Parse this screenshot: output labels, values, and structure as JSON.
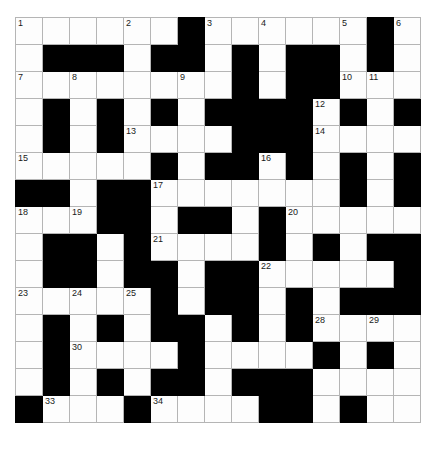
{
  "puzzle": {
    "type": "crossword-grid",
    "rows": 15,
    "columns": 15,
    "cell_size_px": 26,
    "colors": {
      "block": "#000000",
      "cell": "#fdfdfd",
      "grid_line": "#b5b5b5",
      "border": "#8a8a8a",
      "number_text": "#1a1a1a",
      "page_background": "#ffffff"
    },
    "highest_clue_number": 34,
    "grid": [
      [
        "o",
        "o",
        "o",
        "o",
        "o",
        "o",
        "x",
        "o",
        "o",
        "o",
        "o",
        "o",
        "o",
        "x",
        "o"
      ],
      [
        "o",
        "x",
        "x",
        "x",
        "o",
        "x",
        "x",
        "o",
        "x",
        "o",
        "x",
        "x",
        "o",
        "x",
        "o"
      ],
      [
        "o",
        "o",
        "o",
        "o",
        "o",
        "o",
        "o",
        "o",
        "x",
        "o",
        "x",
        "x",
        "o",
        "o",
        "o"
      ],
      [
        "o",
        "x",
        "o",
        "x",
        "o",
        "x",
        "o",
        "x",
        "x",
        "x",
        "x",
        "o",
        "x",
        "o",
        "x"
      ],
      [
        "o",
        "x",
        "o",
        "x",
        "o",
        "o",
        "o",
        "o",
        "x",
        "x",
        "x",
        "o",
        "o",
        "o",
        "o"
      ],
      [
        "o",
        "o",
        "o",
        "o",
        "o",
        "x",
        "o",
        "x",
        "x",
        "o",
        "x",
        "o",
        "x",
        "o",
        "x"
      ],
      [
        "x",
        "x",
        "o",
        "x",
        "x",
        "o",
        "o",
        "o",
        "o",
        "o",
        "o",
        "o",
        "x",
        "o",
        "x"
      ],
      [
        "o",
        "o",
        "o",
        "x",
        "x",
        "o",
        "x",
        "x",
        "o",
        "x",
        "o",
        "o",
        "o",
        "o",
        "o"
      ],
      [
        "o",
        "x",
        "x",
        "o",
        "x",
        "o",
        "o",
        "o",
        "o",
        "x",
        "o",
        "x",
        "o",
        "x",
        "x"
      ],
      [
        "o",
        "x",
        "x",
        "o",
        "x",
        "x",
        "o",
        "x",
        "x",
        "o",
        "o",
        "o",
        "o",
        "o",
        "x"
      ],
      [
        "o",
        "o",
        "o",
        "o",
        "o",
        "x",
        "o",
        "x",
        "x",
        "o",
        "x",
        "o",
        "x",
        "x",
        "x"
      ],
      [
        "o",
        "x",
        "o",
        "x",
        "o",
        "x",
        "x",
        "o",
        "x",
        "o",
        "x",
        "o",
        "o",
        "o",
        "o"
      ],
      [
        "o",
        "x",
        "o",
        "o",
        "o",
        "o",
        "x",
        "o",
        "o",
        "o",
        "o",
        "x",
        "o",
        "x",
        "o"
      ],
      [
        "o",
        "x",
        "o",
        "x",
        "o",
        "x",
        "x",
        "o",
        "x",
        "x",
        "x",
        "o",
        "o",
        "o",
        "o"
      ],
      [
        "x",
        "o",
        "o",
        "o",
        "x",
        "o",
        "o",
        "o",
        "o",
        "x",
        "x",
        "o",
        "x",
        "o",
        "o"
      ]
    ],
    "numbers": [
      {
        "row": 1,
        "col": 1,
        "n": 1
      },
      {
        "row": 1,
        "col": 5,
        "n": 2
      },
      {
        "row": 1,
        "col": 8,
        "n": 3
      },
      {
        "row": 1,
        "col": 10,
        "n": 4
      },
      {
        "row": 1,
        "col": 13,
        "n": 5
      },
      {
        "row": 1,
        "col": 15,
        "n": 6
      },
      {
        "row": 3,
        "col": 1,
        "n": 7
      },
      {
        "row": 3,
        "col": 3,
        "n": 8
      },
      {
        "row": 3,
        "col": 7,
        "n": 9
      },
      {
        "row": 3,
        "col": 13,
        "n": 10
      },
      {
        "row": 3,
        "col": 14,
        "n": 11
      },
      {
        "row": 4,
        "col": 12,
        "n": 12
      },
      {
        "row": 5,
        "col": 5,
        "n": 13
      },
      {
        "row": 5,
        "col": 12,
        "n": 14
      },
      {
        "row": 6,
        "col": 1,
        "n": 15
      },
      {
        "row": 6,
        "col": 10,
        "n": 16
      },
      {
        "row": 7,
        "col": 6,
        "n": 17
      },
      {
        "row": 8,
        "col": 1,
        "n": 18
      },
      {
        "row": 8,
        "col": 3,
        "n": 19
      },
      {
        "row": 8,
        "col": 11,
        "n": 20
      },
      {
        "row": 9,
        "col": 6,
        "n": 21
      },
      {
        "row": 10,
        "col": 10,
        "n": 22
      },
      {
        "row": 11,
        "col": 1,
        "n": 23
      },
      {
        "row": 11,
        "col": 3,
        "n": 24
      },
      {
        "row": 11,
        "col": 5,
        "n": 25
      },
      {
        "row": 12,
        "col": 7,
        "n": 26
      },
      {
        "row": 12,
        "col": 11,
        "n": 27
      },
      {
        "row": 12,
        "col": 12,
        "n": 28
      },
      {
        "row": 12,
        "col": 14,
        "n": 29
      },
      {
        "row": 13,
        "col": 3,
        "n": 30
      },
      {
        "row": 13,
        "col": 7,
        "n": 31
      },
      {
        "row": 14,
        "col": 11,
        "n": 32
      },
      {
        "row": 15,
        "col": 2,
        "n": 33
      },
      {
        "row": 15,
        "col": 6,
        "n": 34
      }
    ],
    "letters": []
  }
}
